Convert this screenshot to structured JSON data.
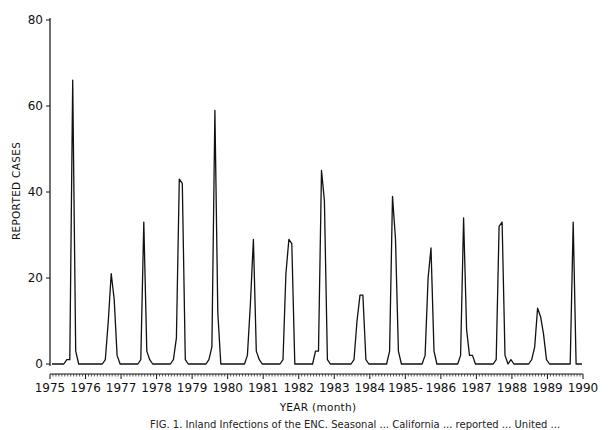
{
  "chart_data": {
    "type": "line",
    "title": "",
    "xlabel": "YEAR (month)",
    "ylabel": "REPORTED CASES",
    "ylim": [
      0,
      80
    ],
    "yticks": [
      0,
      20,
      40,
      60,
      80
    ],
    "xticks": [
      "1975",
      "1976",
      "1977",
      "1978",
      "1979",
      "1980",
      "1981",
      "1982",
      "1983",
      "1984",
      "1985-",
      "1986",
      "1987",
      "1988",
      "1989",
      "1990"
    ],
    "x_range": [
      "1975-01",
      "1990-01"
    ],
    "grid": false,
    "legend": null,
    "series": [
      {
        "name": "Reported cases (monthly)",
        "start": "1975-01",
        "values": [
          0,
          0,
          0,
          0,
          0,
          1,
          1,
          66,
          3,
          0,
          0,
          0,
          0,
          0,
          0,
          0,
          0,
          0,
          1,
          10,
          21,
          15,
          2,
          0,
          0,
          0,
          0,
          0,
          0,
          0,
          1,
          33,
          3,
          1,
          0,
          0,
          0,
          0,
          0,
          0,
          0,
          1,
          6,
          43,
          42,
          1,
          0,
          0,
          0,
          0,
          0,
          0,
          0,
          1,
          4,
          59,
          12,
          0,
          0,
          0,
          0,
          0,
          0,
          0,
          0,
          0,
          2,
          14,
          29,
          3,
          1,
          0,
          0,
          0,
          0,
          0,
          0,
          0,
          1,
          21,
          29,
          28,
          0,
          0,
          0,
          0,
          0,
          0,
          0,
          3,
          3,
          45,
          38,
          1,
          0,
          0,
          0,
          0,
          0,
          0,
          0,
          0,
          1,
          10,
          16,
          16,
          1,
          0,
          0,
          0,
          0,
          0,
          0,
          0,
          3,
          39,
          29,
          3,
          0,
          0,
          0,
          0,
          0,
          0,
          0,
          0,
          2,
          20,
          27,
          3,
          0,
          0,
          0,
          0,
          0,
          0,
          0,
          0,
          2,
          34,
          8,
          2,
          2,
          0,
          0,
          0,
          0,
          0,
          0,
          0,
          1,
          32,
          33,
          2,
          0,
          1,
          0,
          0,
          0,
          0,
          0,
          0,
          1,
          4,
          13,
          11,
          7,
          1,
          0,
          0,
          0,
          0,
          0,
          0,
          0,
          0,
          33,
          0,
          0,
          0
        ]
      }
    ]
  },
  "caption": "FIG. 1. Inland Infections of the ENC. Seasonal ... California ... reported ... United ..."
}
